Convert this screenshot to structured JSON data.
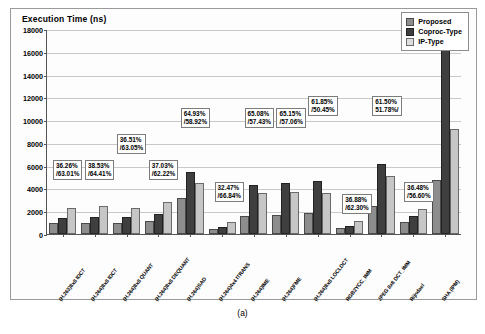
{
  "figure": {
    "caption": "(a)",
    "y_axis_title": "Execution Time (ns)"
  },
  "legend": {
    "position": "top-right",
    "entries": [
      {
        "label": "Proposed",
        "swatch": "hatch-light-gray"
      },
      {
        "label": "Coproc-Type",
        "swatch": "dark-gray"
      },
      {
        "label": "IP-Type",
        "swatch": "light-gray"
      }
    ]
  },
  "chart_data": {
    "type": "bar",
    "title": "",
    "subtitle": "",
    "xlabel": "",
    "ylabel": "Execution Time (ns)",
    "ylim": [
      0,
      18000
    ],
    "ytick_step": 2000,
    "yticks": [
      0,
      2000,
      4000,
      6000,
      8000,
      10000,
      12000,
      14000,
      16000,
      18000
    ],
    "grid": true,
    "legend_position": "top-right",
    "categories": [
      "(H.263)8x8 IDCT",
      "(H.264)8x8 IDCT",
      "(H.264)8x8 QUANT",
      "(H.264)8x8 DEQUANT",
      "(H.264)SAD",
      "(H.264)4x4 ITRANS",
      "(H.264)IME",
      "(H.264)FME",
      "(H.264)8x8 LOCLDCT",
      "RGB2YCC_IMM",
      "JPEG 8x8 DCT_IMM",
      "Rijndael",
      "SHA (IPM)"
    ],
    "series": [
      {
        "name": "Proposed",
        "values": [
          800,
          820,
          800,
          1000,
          3000,
          300,
          1450,
          1500,
          1700,
          350,
          2300,
          900,
          4600
        ]
      },
      {
        "name": "Coproc-Type",
        "values": [
          1250,
          1330,
          1280,
          1580,
          5300,
          450,
          4150,
          4300,
          4450,
          550,
          5950,
          1420,
          17000
        ]
      },
      {
        "name": "IP-Type",
        "values": [
          2150,
          2300,
          2150,
          2650,
          4300,
          900,
          3400,
          3500,
          3450,
          930,
          4900,
          2050,
          9050
        ]
      }
    ],
    "data_labels": [
      {
        "category_index": 0,
        "proposed_reduction": "36.26%",
        "ip_reduction": "63.01%"
      },
      {
        "category_index": 1,
        "proposed_reduction": "38.53%",
        "ip_reduction": "64.41%"
      },
      {
        "category_index": 2,
        "proposed_reduction": "36.51%",
        "ip_reduction": "63.05%"
      },
      {
        "category_index": 3,
        "proposed_reduction": "37.03%",
        "ip_reduction": "62.22%"
      },
      {
        "category_index": 4,
        "proposed_reduction": "64.93%",
        "ip_reduction": "58.92%"
      },
      {
        "category_index": 5,
        "proposed_reduction": "32.47%",
        "ip_reduction": "66.84%"
      },
      {
        "category_index": 6,
        "proposed_reduction": "65.08%",
        "ip_reduction": "57.43%"
      },
      {
        "category_index": 7,
        "proposed_reduction": "65.15%",
        "ip_reduction": "57.06%"
      },
      {
        "category_index": 8,
        "proposed_reduction": "61.85%",
        "ip_reduction": "50.45%"
      },
      {
        "category_index": 9,
        "proposed_reduction": "36.88%",
        "ip_reduction": "62.30%"
      },
      {
        "category_index": 10,
        "proposed_reduction": "61.50%",
        "ip_reduction": "51.78%"
      },
      {
        "category_index": 11,
        "proposed_reduction": "36.48%",
        "ip_reduction": "56.60%"
      },
      {
        "category_index": 12,
        "proposed_reduction": "72.92%",
        "ip_reduction": "49.46%"
      }
    ],
    "callout_text": [
      "36.26%\n/63.01%",
      "38.53%\n/64.41%",
      "36.51%\n/63.05%",
      "37.03%\n/62.22%",
      "64.93%\n/58.92%",
      "32.47%\n/66.84%",
      "65.08%\n/57.43%",
      "65.15%\n/57.06%",
      "61.85%\n/50.45%",
      "36.88%\n/62.30%",
      "61.50%\n51.78%/",
      "36.48%\n/56.60%",
      "72.92%\n/49.46%"
    ]
  }
}
